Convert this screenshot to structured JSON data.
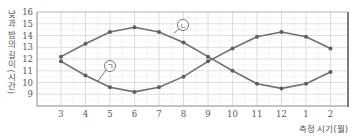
{
  "chart_data": {
    "type": "line",
    "title": "",
    "xlabel": "측정 시기(월)",
    "ylabel": "낮과 밤의 길이(시간)",
    "categories": [
      "3",
      "4",
      "5",
      "6",
      "7",
      "8",
      "9",
      "10",
      "11",
      "12",
      "1",
      "2"
    ],
    "yticks": [
      9,
      10,
      11,
      12,
      13,
      14,
      15,
      16
    ],
    "ylim": [
      8,
      16
    ],
    "grid": true,
    "legend": "inline circled labels",
    "series": [
      {
        "name": "ㄴ",
        "values": [
          12.2,
          13.3,
          14.3,
          14.7,
          14.3,
          13.4,
          12.2,
          11.0,
          9.9,
          9.5,
          9.9,
          10.9
        ]
      },
      {
        "name": "ㄱ",
        "values": [
          11.8,
          10.6,
          9.6,
          9.2,
          9.6,
          10.5,
          11.8,
          12.9,
          13.9,
          14.3,
          13.9,
          12.9
        ]
      }
    ],
    "annotations": [
      {
        "label": "ㄴ",
        "series": 0,
        "circle": [
          183,
          25
        ],
        "anchor": [
          174,
          33
        ]
      },
      {
        "label": "ㄱ",
        "series": 1,
        "circle": [
          110,
          66
        ],
        "anchor": [
          98,
          81
        ]
      }
    ]
  },
  "style": {
    "line_color": "#707070",
    "marker_color": "#5e5e5e",
    "grid_color": "#d6d6d6",
    "frame_color": "#8a8a8a"
  }
}
